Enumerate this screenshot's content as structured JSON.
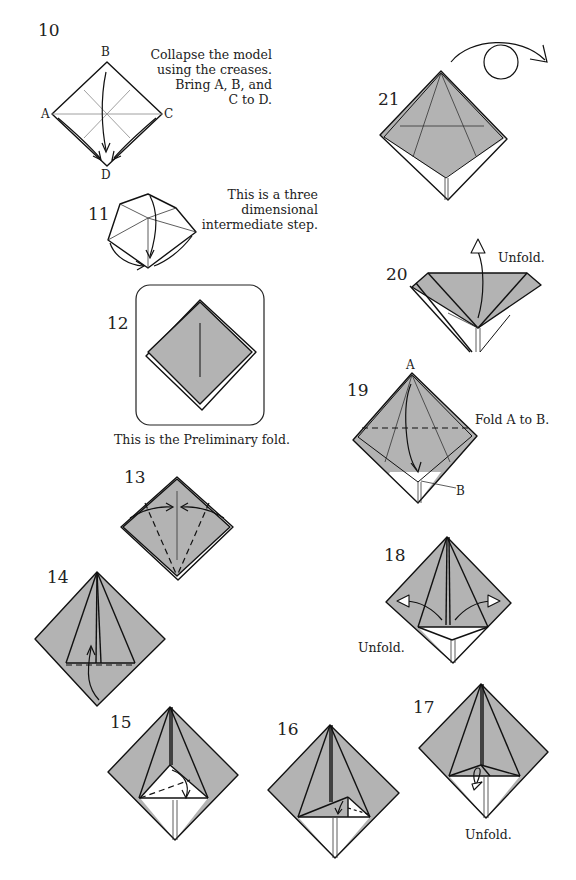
{
  "diagram": {
    "type": "origami-instructions",
    "fill_color": "#b3b3b3",
    "steps": [
      {
        "number": "10",
        "caption": [
          "Collapse the model",
          "using the creases.",
          "Bring A, B, and",
          "C to D."
        ],
        "labels": [
          "A",
          "B",
          "C",
          "D"
        ]
      },
      {
        "number": "11",
        "caption": [
          "This is a three",
          "dimensional",
          "intermediate step."
        ]
      },
      {
        "number": "12",
        "caption": [
          "This is the Preliminary fold."
        ]
      },
      {
        "number": "13",
        "caption": []
      },
      {
        "number": "14",
        "caption": []
      },
      {
        "number": "15",
        "caption": []
      },
      {
        "number": "16",
        "caption": []
      },
      {
        "number": "17",
        "caption": [
          "Unfold."
        ]
      },
      {
        "number": "18",
        "caption": [
          "Unfold."
        ]
      },
      {
        "number": "19",
        "caption": [
          "Fold A to B."
        ],
        "labels": [
          "A",
          "B"
        ]
      },
      {
        "number": "20",
        "caption": [
          "Unfold."
        ]
      },
      {
        "number": "21",
        "caption": [],
        "symbol": "turn-over"
      }
    ]
  }
}
